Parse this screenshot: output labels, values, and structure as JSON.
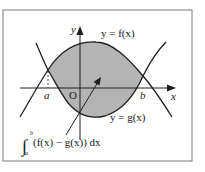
{
  "diagram": {
    "type": "area-between-curves",
    "frame": {
      "x": 3,
      "y": 10,
      "width": 189,
      "height": 151,
      "stroke": "#7a7a7a"
    },
    "colors": {
      "fill": "#b4b4b4",
      "line": "#1e1e1e",
      "background": "#ffffff"
    },
    "axes": {
      "x_label": "x",
      "y_label": "y",
      "origin_label": "O"
    },
    "points": {
      "a_label": "a",
      "b_label": "b"
    },
    "curves": {
      "f_label": "y = f(x)",
      "g_label": "y = g(x)"
    },
    "annotation": {
      "integral_symbol": "∫",
      "upper_limit": "b",
      "lower_limit": "a",
      "integrand": "(f(x) − g(x)) dx"
    }
  }
}
